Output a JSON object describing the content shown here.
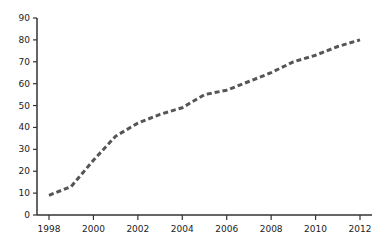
{
  "chart_data": {
    "type": "line",
    "title": "",
    "xlabel": "",
    "ylabel": "",
    "x": [
      1998,
      1999,
      2000,
      2001,
      2002,
      2003,
      2004,
      2005,
      2006,
      2007,
      2008,
      2009,
      2010,
      2011,
      2012
    ],
    "series": [
      {
        "name": "series-1",
        "values": [
          9,
          13,
          25,
          36,
          42,
          46,
          49,
          55,
          57,
          61,
          65,
          70,
          73,
          77,
          80
        ],
        "color": "#555555",
        "line_style": "dashed"
      }
    ],
    "x_ticks": [
      "1998",
      "2000",
      "2002",
      "2004",
      "2006",
      "2008",
      "2010",
      "2012"
    ],
    "y_ticks": [
      "0",
      "10",
      "20",
      "30",
      "40",
      "50",
      "60",
      "70",
      "80",
      "90"
    ],
    "xlim": [
      1998,
      2012
    ],
    "ylim": [
      0,
      90
    ],
    "grid": false,
    "legend": null
  }
}
